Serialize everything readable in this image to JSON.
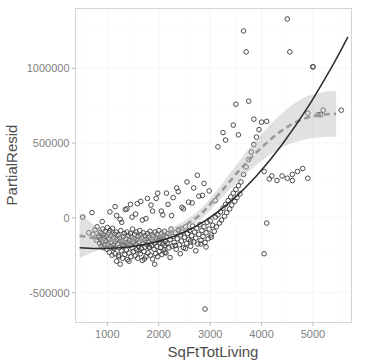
{
  "chart_data": {
    "type": "scatter",
    "title": "",
    "subtitle": "",
    "xlabel": "SqFtTotLiving",
    "ylabel": "PartialResid",
    "xlim": [
      380,
      5750
    ],
    "ylim": [
      -700000,
      1400000
    ],
    "grid": true,
    "legend": false,
    "xticks": [
      1000,
      2000,
      3000,
      4000,
      5000
    ],
    "xtick_labels": [
      "1000",
      "2000",
      "3000",
      "4000",
      "5000"
    ],
    "yticks": [
      -500000,
      0,
      500000,
      1000000
    ],
    "ytick_labels": [
      "-500000",
      "0",
      "500000",
      "1000000"
    ],
    "annotations": [],
    "series": [
      {
        "name": "partial residuals",
        "marker": "open-circle",
        "color": "#3a3a3a",
        "x": [
          520,
          640,
          700,
          720,
          760,
          790,
          800,
          820,
          840,
          850,
          860,
          870,
          880,
          890,
          900,
          910,
          920,
          930,
          940,
          950,
          960,
          970,
          980,
          990,
          1000,
          1010,
          1020,
          1030,
          1040,
          1050,
          1060,
          1070,
          1080,
          1090,
          1100,
          1110,
          1120,
          1130,
          1140,
          1150,
          1160,
          1170,
          1180,
          1190,
          1200,
          1210,
          1220,
          1230,
          1240,
          1250,
          1260,
          1270,
          1280,
          1290,
          1300,
          1310,
          1320,
          1330,
          1340,
          1350,
          1360,
          1370,
          1380,
          1390,
          1400,
          1410,
          1420,
          1430,
          1440,
          1450,
          1460,
          1470,
          1480,
          1490,
          1500,
          1510,
          1520,
          1530,
          1540,
          1550,
          1560,
          1570,
          1580,
          1590,
          1600,
          1610,
          1620,
          1630,
          1640,
          1650,
          1660,
          1670,
          1680,
          1690,
          1700,
          1710,
          1720,
          1730,
          1740,
          1750,
          1760,
          1770,
          1780,
          1790,
          1800,
          1810,
          1820,
          1830,
          1840,
          1850,
          1860,
          1870,
          1880,
          1890,
          1900,
          1910,
          1920,
          1930,
          1940,
          1950,
          1960,
          1970,
          1980,
          1990,
          2000,
          2010,
          2020,
          2030,
          2040,
          2050,
          2060,
          2070,
          2080,
          2090,
          2100,
          2110,
          2120,
          2130,
          2140,
          2150,
          2160,
          2180,
          2200,
          2220,
          2240,
          2260,
          2280,
          2300,
          2320,
          2340,
          2360,
          2380,
          2400,
          2420,
          2440,
          2460,
          2480,
          2500,
          2520,
          2540,
          2560,
          2580,
          2600,
          2620,
          2640,
          2660,
          2680,
          2700,
          2720,
          2740,
          2760,
          2780,
          2800,
          2820,
          2840,
          2860,
          2880,
          2900,
          2920,
          2940,
          2960,
          2980,
          3000,
          3020,
          3050,
          3080,
          3100,
          3120,
          3150,
          3180,
          3200,
          3220,
          3250,
          3280,
          3300,
          3320,
          3350,
          3380,
          3400,
          3420,
          3450,
          3480,
          3500,
          3520,
          3550,
          3580,
          3600,
          3650,
          3700,
          3750,
          3800,
          3850,
          3900,
          3950,
          4000,
          4050,
          4100,
          4150,
          4200,
          4300,
          4400,
          4500,
          4600,
          4700,
          4800,
          4900,
          5000,
          5100,
          5200,
          5550,
          900,
          1050,
          1150,
          1250,
          1350,
          1450,
          1550,
          1650,
          1750,
          1850,
          1950,
          2050,
          2150,
          2250,
          2350,
          2450,
          2550,
          2650,
          2750,
          2850,
          1120,
          1220,
          1320,
          1420,
          1520,
          1620,
          1720,
          1820,
          1920,
          2020,
          2120,
          2220,
          2320,
          2420,
          2520,
          2620,
          2720,
          2820,
          2920,
          3020,
          1180,
          1280,
          1380,
          1480,
          1580,
          1680,
          1780,
          1880,
          1980,
          2080,
          2180,
          2280,
          2380,
          2480,
          2580,
          2680,
          2780,
          2880,
          2980,
          3100,
          2900,
          3650,
          4500,
          3700,
          4550,
          5000,
          4050,
          3750,
          3500,
          3450,
          3550,
          3300,
          3250,
          3150,
          3850,
          4100,
          4600,
          4900,
          5150
        ],
        "y": [
          5000,
          -100000,
          35000,
          -110000,
          -80000,
          -150000,
          -60000,
          -130000,
          -120000,
          -170000,
          -95000,
          -145000,
          -190000,
          -105000,
          -160000,
          -75000,
          -200000,
          -115000,
          -135000,
          -180000,
          -90000,
          -155000,
          -125000,
          -210000,
          -65000,
          -175000,
          -140000,
          -100000,
          -230000,
          -85000,
          -165000,
          -195000,
          -120000,
          -250000,
          -70000,
          -185000,
          -130000,
          -205000,
          -110000,
          -240000,
          -160000,
          -95000,
          -290000,
          -145000,
          -175000,
          -115000,
          -260000,
          -200000,
          -135000,
          -310000,
          -85000,
          -220000,
          -155000,
          -180000,
          -270000,
          -125000,
          -190000,
          -105000,
          -245000,
          -165000,
          -140000,
          -215000,
          -95000,
          -280000,
          -170000,
          -120000,
          -235000,
          -150000,
          -185000,
          -105000,
          -260000,
          -130000,
          -200000,
          -75000,
          -165000,
          -225000,
          -140000,
          -110000,
          -255000,
          -180000,
          -95000,
          -215000,
          -145000,
          -270000,
          -125000,
          -190000,
          -160000,
          -85000,
          -240000,
          -115000,
          -205000,
          -135000,
          -285000,
          -170000,
          -100000,
          -225000,
          -150000,
          -195000,
          -120000,
          -260000,
          -140000,
          -180000,
          -105000,
          -235000,
          -165000,
          -130000,
          -200000,
          -90000,
          -250000,
          -145000,
          -185000,
          -115000,
          -275000,
          -155000,
          -125000,
          -210000,
          -170000,
          -95000,
          -240000,
          -135000,
          -190000,
          -110000,
          -260000,
          -150000,
          -85000,
          -225000,
          -165000,
          -130000,
          -200000,
          -105000,
          -245000,
          -140000,
          -175000,
          -120000,
          -215000,
          -90000,
          -185000,
          -155000,
          -235000,
          -125000,
          -170000,
          -105000,
          -200000,
          -145000,
          -75000,
          -190000,
          -125000,
          -165000,
          -100000,
          -210000,
          -140000,
          -80000,
          -180000,
          -115000,
          -155000,
          -95000,
          -200000,
          -130000,
          -60000,
          -170000,
          -105000,
          -145000,
          -85000,
          -190000,
          -120000,
          -55000,
          -160000,
          -95000,
          -135000,
          -70000,
          -175000,
          -110000,
          -45000,
          -150000,
          -85000,
          -125000,
          -60000,
          -165000,
          -100000,
          -30000,
          -140000,
          -75000,
          -20000,
          -115000,
          -50000,
          -90000,
          5000,
          -60000,
          20000,
          -35000,
          40000,
          -15000,
          65000,
          10000,
          90000,
          35000,
          115000,
          60000,
          140000,
          85000,
          165000,
          110000,
          190000,
          135000,
          215000,
          160000,
          240000,
          290000,
          340000,
          390000,
          440000,
          490000,
          540000,
          590000,
          640000,
          310000,
          -35000,
          260000,
          280000,
          250000,
          280000,
          265000,
          290000,
          310000,
          330000,
          700000,
          1010000,
          690000,
          720000,
          720000,
          -25000,
          40000,
          75000,
          -10000,
          55000,
          90000,
          25000,
          110000,
          -5000,
          85000,
          130000,
          45000,
          165000,
          15000,
          200000,
          70000,
          240000,
          100000,
          285000,
          150000,
          -200000,
          -250000,
          -180000,
          -290000,
          -160000,
          -220000,
          -275000,
          -195000,
          -310000,
          -145000,
          -230000,
          -265000,
          -185000,
          -240000,
          -205000,
          -155000,
          -220000,
          -175000,
          -195000,
          -130000,
          15000,
          -30000,
          60000,
          5000,
          95000,
          -15000,
          130000,
          45000,
          165000,
          20000,
          90000,
          135000,
          175000,
          60000,
          105000,
          200000,
          145000,
          230000,
          180000,
          115000,
          -610000,
          1250000,
          1330000,
          1110000,
          1110000,
          1010000,
          -240000,
          780000,
          760000,
          620000,
          555000,
          520000,
          570000,
          475000,
          660000,
          645000,
          250000,
          265000,
          690000
        ]
      }
    ],
    "fits": [
      {
        "name": "polynomial-fit",
        "style": "solid",
        "color": "#2b2b2b",
        "x": [
          460,
          900,
          1400,
          1900,
          2400,
          2900,
          3400,
          3900,
          4400,
          4900,
          5400,
          5680
        ],
        "y": [
          -200000,
          -205000,
          -195000,
          -165000,
          -110000,
          -20000,
          110000,
          280000,
          490000,
          740000,
          1030000,
          1210000
        ]
      },
      {
        "name": "loess-smoother",
        "style": "dashed",
        "color": "#9a9a9a",
        "x": [
          460,
          800,
          1200,
          1600,
          2000,
          2400,
          2800,
          3200,
          3600,
          4000,
          4400,
          4800,
          5200,
          5450
        ],
        "y": [
          -120000,
          -140000,
          -155000,
          -150000,
          -125000,
          -70000,
          20000,
          170000,
          330000,
          470000,
          585000,
          660000,
          690000,
          695000
        ],
        "ci_upper": [
          30000,
          -60000,
          -110000,
          -115000,
          -95000,
          -40000,
          55000,
          215000,
          395000,
          560000,
          700000,
          800000,
          840000,
          850000
        ],
        "ci_lower": [
          -270000,
          -220000,
          -200000,
          -185000,
          -155000,
          -100000,
          -15000,
          125000,
          265000,
          380000,
          470000,
          520000,
          540000,
          540000
        ]
      }
    ]
  },
  "panel": {
    "bg_color": "#ffffff",
    "border_color": "#d4d4d4",
    "grid_color": "#f2f2f2"
  }
}
